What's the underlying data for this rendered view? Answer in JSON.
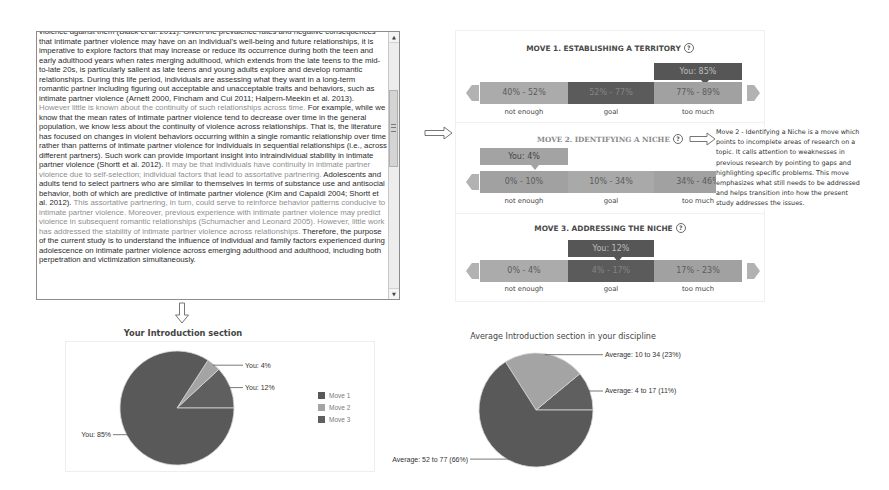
{
  "textbox": {
    "paragraphs": [
      {
        "segments": [
          {
            "tone": "dark",
            "text": "violence against them (Black et al. 2011). Given the prevalence rates and negative consequences that intimate partner violence may have on an individual's well-being and future relationships, it is imperative to explore factors that may increase or reduce its occurrence during both the teen and early adulthood years when rates merging adulthood, which extends from the late teens to the mid-to-late 20s, is particularly salient as late teens and young adults explore and develop romantic relationships. During this life period, individuals are assessing what they want in a long-term romantic partner including figuring out acceptable and unacceptable traits and behaviors, such as intimate partner violence (Arnett 2000, Fincham and Cui 2011; Halpern-Meekin et al. 2013)."
          }
        ]
      },
      {
        "segments": [
          {
            "tone": "light",
            "text": "However little is known about the continuity of such relationships across time."
          },
          {
            "tone": "dark",
            "text": " For example, while we know that the mean rates of intimate partner violence tend to decrease over time in the general population, we know less about the continuity of violence across relationships. That is, the literature has focused on changes in violent behaviors occurring within a single romantic relationship over time rather than patterns of intimate partner violence for individuals in sequential relationships (i.e., across different partners). Such work can provide important insight into intraindividual stability in intimate partner violence (Shortt et al. 2012)."
          },
          {
            "tone": "light",
            "text": " It may be that individuals have continuity in intimate partner violence due to self-selection; individual factors that lead to assortative partnering."
          },
          {
            "tone": "dark",
            "text": " Adolescents and adults tend to select partners who are similar to themselves in terms of substance use and antisocial behavior, both of which are predictive of intimate partner violence (Kim and Capaldi 2004; Shortt et al. 2012)."
          },
          {
            "tone": "light",
            "text": " This assortative partnering, in turn, could serve to reinforce behavior patterns conducive to intimate partner violence. Moreover, previous experience with intimate partner violence may predict violence in subsequent romantic relationships (Schumacher and Leonard 2005). However, little work has addressed the stability of intimate partner violence across relationships."
          },
          {
            "tone": "dark",
            "text": " Therefore, the purpose of the current study is to understand the influence of individual and family factors experienced during adolescence on intimate partner violence across emerging adulthood and adulthood, including both perpetration and victimization simultaneously."
          }
        ]
      }
    ],
    "scrollbar": {
      "up_glyph": "▲",
      "down_glyph": "▼"
    }
  },
  "moves": [
    {
      "title": "MOVE 1. ESTABLISHING A TERRITORY",
      "help_icon": "question-circle-icon",
      "you_label": "You: 85%",
      "you_value": 85,
      "ranges": [
        {
          "label": "not enough",
          "range": "40% - 52%"
        },
        {
          "label": "goal",
          "range": "52% - 77%"
        },
        {
          "label": "too much",
          "range": "77% - 89%"
        }
      ]
    },
    {
      "title": "MOVE 2. IDENTIFYING A NICHE",
      "help_icon": "question-circle-icon",
      "you_label": "You: 4%",
      "you_value": 4,
      "ranges": [
        {
          "label": "not enough",
          "range": "0% - 10%"
        },
        {
          "label": "goal",
          "range": "10% - 34%"
        },
        {
          "label": "too much",
          "range": "34% - 46%"
        }
      ]
    },
    {
      "title": "MOVE 3. ADDRESSING THE NICHE",
      "help_icon": "question-circle-icon",
      "you_label": "You: 12%",
      "you_value": 12,
      "ranges": [
        {
          "label": "not enough",
          "range": "0% - 4%"
        },
        {
          "label": "goal",
          "range": "4% - 17%"
        },
        {
          "label": "too much",
          "range": "17% - 23%"
        }
      ]
    }
  ],
  "move_description": {
    "text": "Move 2 - Identifying a Niche is a move which points to incomplete areas of research on a topic. It calls attention to weaknesses in previous research by pointing to gaps and highlighting specific problems. This move emphasizes what still needs to be addressed and helps transition into how the present study addresses the issues."
  },
  "colors": {
    "dark_gray": "#565656",
    "mid_gray": "#a3a3a3",
    "light_gray": "#ababab"
  },
  "chart_data": [
    {
      "type": "pie",
      "title": "Your Introduction section",
      "labels": [
        "Move 1",
        "Move 2",
        "Move 3"
      ],
      "values": [
        85,
        4,
        12
      ],
      "data_labels": [
        "You: 85%",
        "You: 4%",
        "You: 12%"
      ],
      "colors": [
        "#595959",
        "#a4a4a4",
        "#5f5f5f"
      ],
      "legend": [
        "Move 1",
        "Move 2",
        "Move 3"
      ],
      "legend_position": "right"
    },
    {
      "type": "pie",
      "title": "Average Introduction section in your discipline",
      "labels": [
        "Move 1",
        "Move 2",
        "Move 3"
      ],
      "values": [
        66,
        23,
        11
      ],
      "data_labels": [
        "Average: 52 to 77 (66%)",
        "Average: 10 to 34 (23%)",
        "Average: 4 to 17 (11%)"
      ],
      "colors": [
        "#595959",
        "#a4a4a4",
        "#5f5f5f"
      ]
    }
  ]
}
